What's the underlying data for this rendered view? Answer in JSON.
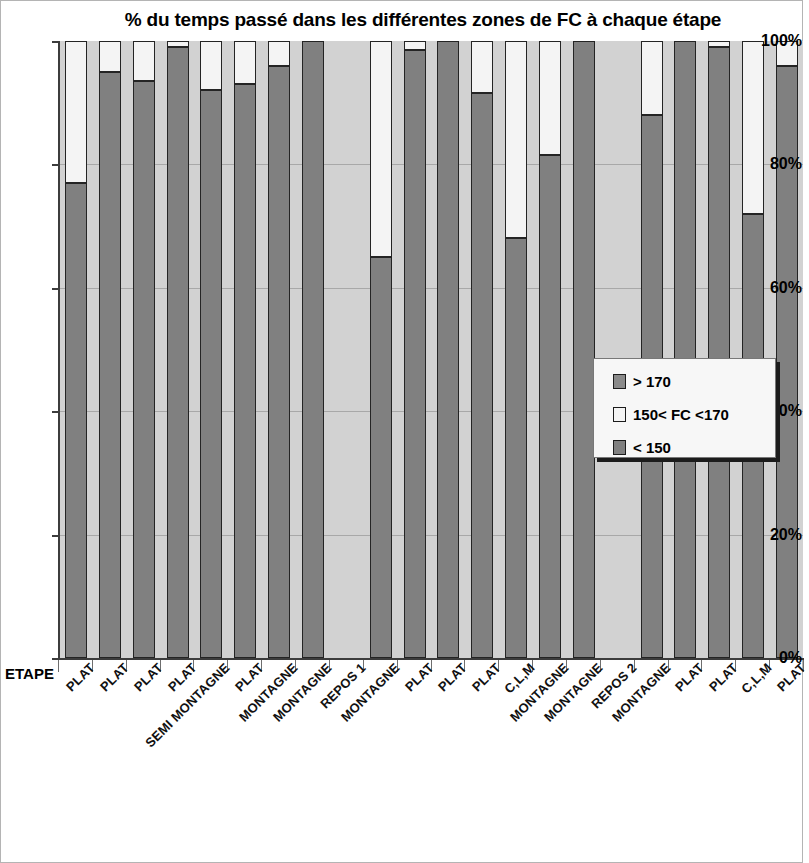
{
  "chart_data": {
    "type": "bar",
    "subtype": "stacked-100-percent",
    "title": "%  du temps passé dans les différentes zones de FC à chaque étape",
    "xlabel": "ETAPE",
    "ylabel": "",
    "ylim": [
      0,
      100
    ],
    "ytick_labels": [
      "0%",
      "20%",
      "40%",
      "60%",
      "80%",
      "100%"
    ],
    "ytick_values": [
      0,
      20,
      40,
      60,
      80,
      100
    ],
    "grid": true,
    "legend_position": "center-right",
    "categories": [
      "PLAT",
      "PLAT",
      "PLAT",
      "PLAT",
      "SEMI MONTAGNE",
      "PLAT",
      "MONTAGNE",
      "MONTAGNE",
      "REPOS 1",
      "MONTAGNE",
      "PLAT",
      "PLAT",
      "PLAT",
      "C,L,M",
      "MONTAGNE",
      "MONTAGNE",
      "REPOS 2",
      "MONTAGNE",
      "PLAT",
      "PLAT",
      "C,L,M",
      "PLAT"
    ],
    "series": [
      {
        "name": "< 150",
        "color": "#808080",
        "values": [
          77,
          95,
          93.5,
          99,
          92,
          93,
          96,
          100,
          null,
          65,
          98.5,
          100,
          91.5,
          68,
          81.5,
          100,
          null,
          88,
          100,
          99,
          72,
          96
        ]
      },
      {
        "name": "150< FC <170",
        "color": "#f4f4f4",
        "values": [
          23,
          5,
          6.5,
          1,
          8,
          7,
          4,
          0,
          null,
          35,
          1.5,
          0,
          8.5,
          32,
          18.5,
          0,
          null,
          12,
          0,
          1,
          28,
          4
        ]
      },
      {
        "name": "> 170",
        "color": "#8a8a8a",
        "values": [
          0,
          0,
          0,
          0,
          0,
          0,
          0,
          0,
          null,
          0,
          0,
          0,
          0,
          0,
          0,
          0,
          null,
          0,
          0,
          0,
          0,
          0
        ]
      }
    ],
    "legend_entries": [
      {
        "label": "> 170",
        "color": "#8a8a8a"
      },
      {
        "label": "150< FC <170",
        "color": "#f4f4f4"
      },
      {
        "label": "< 150",
        "color": "#808080"
      }
    ]
  }
}
